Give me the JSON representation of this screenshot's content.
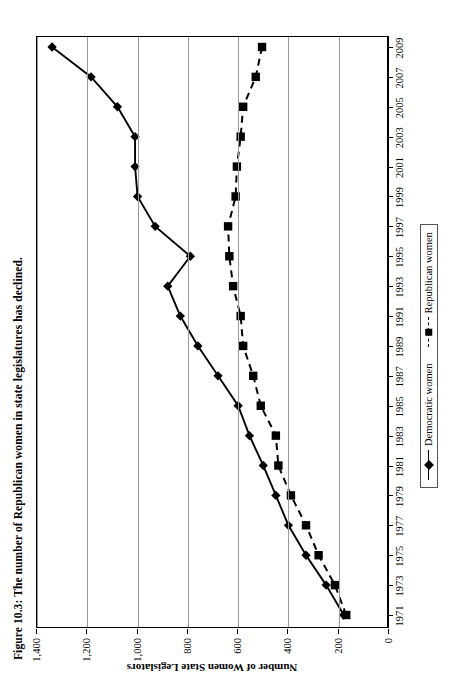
{
  "figure": {
    "title": "Figure 10.3:  The number of Republican women in state legislatures has declined."
  },
  "chart_data": {
    "type": "line",
    "title": "Figure 10.3:  The number of Republican women in state legislatures has declined.",
    "xlabel": "",
    "ylabel": "Number of Women State Legislators",
    "x": [
      1971,
      1973,
      1975,
      1977,
      1979,
      1981,
      1983,
      1985,
      1987,
      1989,
      1991,
      1993,
      1995,
      1997,
      1999,
      2001,
      2003,
      2005,
      2007,
      2009
    ],
    "categories": [
      "1971",
      "1973",
      "1975",
      "1977",
      "1979",
      "1981",
      "1983",
      "1985",
      "1987",
      "1989",
      "1991",
      "1993",
      "1995",
      "1997",
      "1999",
      "2001",
      "2003",
      "2005",
      "2007",
      "2009"
    ],
    "xtick_labels": [
      "1971",
      "1973",
      "1975",
      "1977",
      "1979",
      "1981",
      "1983",
      "1985",
      "1987",
      "1989",
      "1991",
      "1993",
      "1995",
      "1997",
      "1999",
      "2001",
      "2003",
      "2005",
      "2007",
      "2009"
    ],
    "ytick_labels": [
      "0",
      "200",
      "400",
      "600",
      "800",
      "1,000",
      "1,200",
      "1,400"
    ],
    "ytick_values": [
      0,
      200,
      400,
      600,
      800,
      1000,
      1200,
      1400
    ],
    "ylim": [
      0,
      1400
    ],
    "xlim": [
      1971,
      2009
    ],
    "grid": "vertical-only-horizontal-value-gridlines",
    "legend_position": "below-axis-center",
    "series": [
      {
        "name": "Democratic women",
        "marker": "diamond",
        "linestyle": "solid",
        "color": "#000000",
        "values": [
          180,
          250,
          330,
          400,
          450,
          500,
          555,
          600,
          680,
          760,
          830,
          880,
          790,
          930,
          1000,
          1010,
          1010,
          1080,
          1185,
          1340
        ]
      },
      {
        "name": "Republican women",
        "marker": "square",
        "linestyle": "dashed",
        "color": "#000000",
        "values": [
          170,
          215,
          280,
          330,
          390,
          440,
          450,
          510,
          540,
          580,
          590,
          620,
          635,
          640,
          610,
          605,
          590,
          580,
          530,
          505
        ]
      }
    ]
  },
  "legend": {
    "entries": [
      {
        "label": "Democratic women",
        "marker": "diamond",
        "linestyle": "solid"
      },
      {
        "label": "Republican women",
        "marker": "square",
        "linestyle": "dashed"
      }
    ]
  },
  "axes": {
    "y_axis_title": "Number of Women State Legislators"
  }
}
